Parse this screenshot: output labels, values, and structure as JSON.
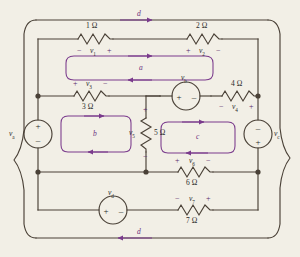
{
  "figure": {
    "kind": "circuit-schematic",
    "background_color": "#f2efe6",
    "wire_color": "#4a4137",
    "mesh_color": "#7a3a8c",
    "polarity_color": "#5b2a6e",
    "text_color": "#2b2b2b"
  },
  "resistors": [
    {
      "id": "r1",
      "label": "1 Ω",
      "voltage": "v",
      "sub": "1",
      "left_sign": "−",
      "right_sign": "+",
      "orientation": "horizontal"
    },
    {
      "id": "r2",
      "label": "2 Ω",
      "voltage": "v",
      "sub": "2",
      "left_sign": "+",
      "right_sign": "−",
      "orientation": "horizontal"
    },
    {
      "id": "r3",
      "label": "3 Ω",
      "voltage": "v",
      "sub": "3",
      "left_sign": "+",
      "right_sign": "−",
      "orientation": "horizontal"
    },
    {
      "id": "r4",
      "label": "4 Ω",
      "voltage": "v",
      "sub": "4",
      "left_sign": "−",
      "right_sign": "+",
      "orientation": "horizontal"
    },
    {
      "id": "r5",
      "label": "5 Ω",
      "voltage": "v",
      "sub": "5",
      "left_sign": "+",
      "right_sign": "−",
      "orientation": "vertical"
    },
    {
      "id": "r6",
      "label": "6 Ω",
      "voltage": "v",
      "sub": "6",
      "left_sign": "+",
      "right_sign": "−",
      "orientation": "horizontal"
    },
    {
      "id": "r7",
      "label": "7 Ω",
      "voltage": "v",
      "sub": "7",
      "left_sign": "−",
      "right_sign": "+",
      "orientation": "horizontal"
    }
  ],
  "sources": [
    {
      "id": "va",
      "label": "v",
      "sub": "a",
      "orientation": "vertical",
      "top_sign": "+",
      "bottom_sign": "−",
      "label_side": "left"
    },
    {
      "id": "vb",
      "label": "v",
      "sub": "b",
      "orientation": "horizontal",
      "left_sign": "+",
      "right_sign": "−",
      "label_side": "above"
    },
    {
      "id": "vc",
      "label": "v",
      "sub": "c",
      "orientation": "vertical",
      "top_sign": "−",
      "bottom_sign": "+",
      "label_side": "right"
    },
    {
      "id": "vd",
      "label": "v",
      "sub": "d",
      "orientation": "horizontal",
      "left_sign": "+",
      "right_sign": "−",
      "label_side": "above"
    }
  ],
  "meshes": [
    {
      "id": "mesh-a",
      "label": "a",
      "direction": "clockwise"
    },
    {
      "id": "mesh-b",
      "label": "b",
      "direction": "clockwise"
    },
    {
      "id": "mesh-c",
      "label": "c",
      "direction": "clockwise"
    },
    {
      "id": "mesh-d-top",
      "label": "d",
      "direction": "clockwise"
    },
    {
      "id": "mesh-d-bottom",
      "label": "d",
      "direction": "clockwise"
    }
  ],
  "text": {
    "r1_label": "1 Ω",
    "r2_label": "2 Ω",
    "r3_label": "3 Ω",
    "r4_label": "4 Ω",
    "r5_label": "5 Ω",
    "r6_label": "6 Ω",
    "r7_label": "7 Ω",
    "v1": "v",
    "v1s": "1",
    "v2": "v",
    "v2s": "2",
    "v3": "v",
    "v3s": "3",
    "v4": "v",
    "v4s": "4",
    "v5": "v",
    "v5s": "5",
    "v6": "v",
    "v6s": "6",
    "v7": "v",
    "v7s": "7",
    "va": "v",
    "vas": "a",
    "vb": "v",
    "vbs": "b",
    "vc": "v",
    "vcs": "c",
    "vd": "v",
    "vds": "d",
    "mesh_a": "a",
    "mesh_b": "b",
    "mesh_c": "c",
    "mesh_d1": "d",
    "mesh_d2": "d",
    "plus": "+",
    "minus": "−",
    "r1_left": "−",
    "r1_right": "+",
    "r2_left": "+",
    "r2_right": "−",
    "r3_left": "+",
    "r3_right": "−",
    "r4_left": "−",
    "r4_right": "+",
    "r5_top": "+",
    "r5_bot": "−",
    "r6_left": "+",
    "r6_right": "−",
    "r7_left": "−",
    "r7_right": "+",
    "va_top": "+",
    "va_bot": "−",
    "vb_left": "+",
    "vb_right": "−",
    "vc_top": "−",
    "vc_bot": "+",
    "vd_left": "+",
    "vd_right": "−"
  }
}
